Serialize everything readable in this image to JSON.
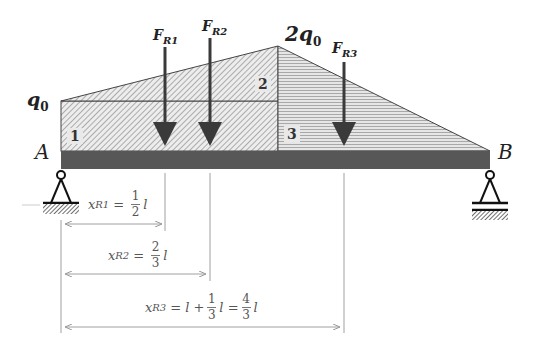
{
  "diagram": {
    "colors": {
      "beam": "#575757",
      "arrow": "#3a3a3a",
      "hatch_regions_1_2": "#b9b9b9",
      "hatch_region_3": "#c4c4c4",
      "dimension_line": "#9a9a9a"
    },
    "load_labels": {
      "left_intensity": "q",
      "left_intensity_sub": "0",
      "peak_intensity": "2q",
      "peak_intensity_sub": "0"
    },
    "supports": {
      "left": "A",
      "right": "B"
    },
    "regions": [
      {
        "id": "1",
        "label": "1",
        "shape": "rectangle"
      },
      {
        "id": "2",
        "label": "2",
        "shape": "triangle"
      },
      {
        "id": "3",
        "label": "3",
        "shape": "triangle"
      }
    ],
    "forces": [
      {
        "name": "F",
        "sub": "R1"
      },
      {
        "name": "F",
        "sub": "R2"
      },
      {
        "name": "F",
        "sub": "R3"
      }
    ],
    "dimensions": [
      {
        "var": "x",
        "sub": "R1",
        "eq": "=",
        "num": "1",
        "den": "2",
        "tail": "l"
      },
      {
        "var": "x",
        "sub": "R2",
        "eq": "=",
        "num": "2",
        "den": "3",
        "tail": "l"
      },
      {
        "var": "x",
        "sub": "R3",
        "eq": "=",
        "lead": "l +",
        "num": "1",
        "den": "3",
        "mid": "l =",
        "num2": "4",
        "den2": "3",
        "tail": "l"
      }
    ]
  }
}
